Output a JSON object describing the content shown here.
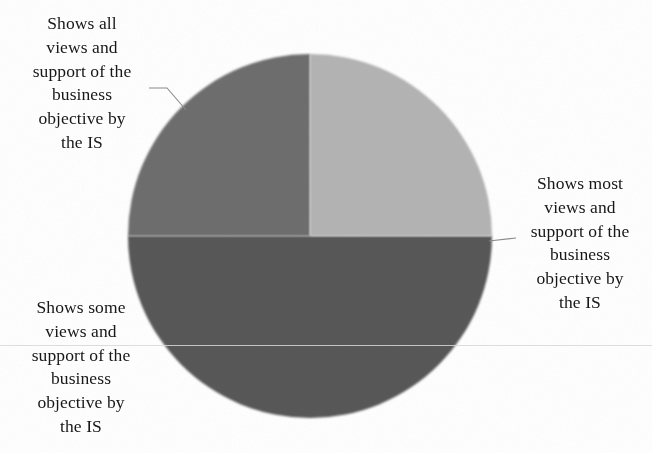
{
  "chart_data": {
    "type": "pie",
    "title": "",
    "categories": [
      "Shows most views and support of the business objective by the IS",
      "Shows all views and support of the business objective by the IS",
      "Shows some views and support of the business objective by the IS"
    ],
    "values": [
      50,
      25,
      25
    ],
    "value_unit": "percent",
    "colors": [
      "#585858",
      "#6e6e6e",
      "#b4b4b4"
    ],
    "legend": "none",
    "labels_position": "outside-with-leader-lines",
    "grid": false,
    "start_angle_deg": 0,
    "direction": "clockwise",
    "center": {
      "x": 310,
      "y": 236
    },
    "radius": 182,
    "slices": [
      {
        "name": "Shows most views and support of the business objective by the IS",
        "value": 50,
        "color": "#585858",
        "label_lines": [
          "Shows most",
          "views and",
          "support of the",
          "business",
          "objective by",
          "the IS"
        ],
        "label_side": "right"
      },
      {
        "name": "Shows all views and support of the business objective by the IS",
        "value": 25,
        "color": "#6e6e6e",
        "label_lines": [
          "Shows all",
          "views and",
          "support of the",
          "business",
          "objective by",
          "the IS"
        ],
        "label_side": "top-left"
      },
      {
        "name": "Shows some views and support of the business objective by the IS",
        "value": 25,
        "color": "#b4b4b4",
        "label_lines": [
          "Shows some",
          "views and",
          "support of the",
          "business",
          "objective by",
          "the IS"
        ],
        "label_side": "bottom-left"
      }
    ]
  },
  "labels": {
    "all": {
      "line1": "Shows all",
      "line2": "views and",
      "line3": "support of the",
      "line4": "business",
      "line5": "objective by",
      "line6": "the IS"
    },
    "most": {
      "line1": "Shows most",
      "line2": "views and",
      "line3": "support of the",
      "line4": "business",
      "line5": "objective by",
      "line6": "the IS"
    },
    "some": {
      "line1": "Shows some",
      "line2": "views and",
      "line3": "support of the",
      "line4": "business",
      "line5": "objective by",
      "line6": "the IS"
    }
  }
}
